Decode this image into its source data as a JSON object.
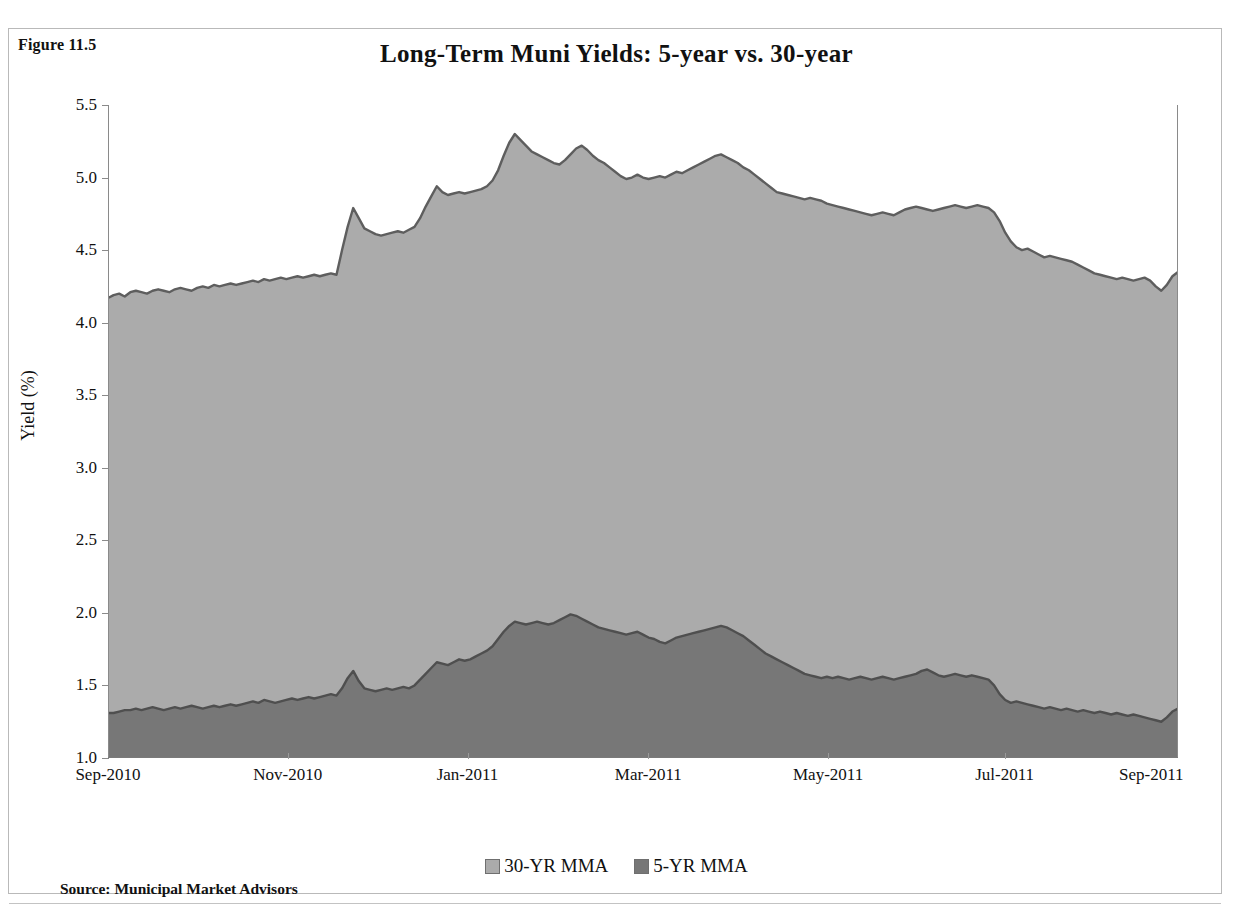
{
  "figure": {
    "label": "Figure 11.5",
    "title": "Long-Term Muni Yields: 5-year vs. 30-year",
    "source": "Source: Municipal Market Advisors"
  },
  "axes": {
    "ylabel": "Yield (%)",
    "xlabel": "",
    "yticks": [
      "1.0",
      "1.5",
      "2.0",
      "2.5",
      "3.0",
      "3.5",
      "4.0",
      "4.5",
      "5.0",
      "5.5"
    ],
    "xticks": [
      "Sep-2010",
      "Nov-2010",
      "Jan-2011",
      "Mar-2011",
      "May-2011",
      "Jul-2011",
      "Sep-2011"
    ]
  },
  "legend": [
    {
      "label": "30-YR MMA",
      "color": "#ababab"
    },
    {
      "label": "5-YR MMA",
      "color": "#777777"
    }
  ],
  "colors": {
    "band_30yr": "#ababab",
    "band_5yr": "#777777",
    "line_stroke": "#5e5e5e",
    "frame": "#b9b9b9",
    "axis": "#8a8a8a"
  },
  "chart_data": {
    "type": "area",
    "title": "Long-Term Muni Yields: 5-year vs. 30-year",
    "xlabel": "",
    "ylabel": "Yield (%)",
    "ylim": [
      1.0,
      5.5
    ],
    "ytick_step": 0.5,
    "grid": false,
    "legend_position": "bottom",
    "xlim": [
      "Sep-2010",
      "Oct-2011"
    ],
    "x_tick_labels": [
      "Sep-2010",
      "Nov-2010",
      "Jan-2011",
      "Mar-2011",
      "May-2011",
      "Jul-2011",
      "Sep-2011"
    ],
    "x_tick_fractions": [
      0.0,
      0.168,
      0.336,
      0.505,
      0.673,
      0.838,
      0.975
    ],
    "series": [
      {
        "name": "30-YR MMA",
        "color": "#ababab",
        "values": [
          4.17,
          4.19,
          4.2,
          4.18,
          4.21,
          4.22,
          4.21,
          4.2,
          4.22,
          4.23,
          4.22,
          4.21,
          4.23,
          4.24,
          4.23,
          4.22,
          4.24,
          4.25,
          4.24,
          4.26,
          4.25,
          4.26,
          4.27,
          4.26,
          4.27,
          4.28,
          4.29,
          4.28,
          4.3,
          4.29,
          4.3,
          4.31,
          4.3,
          4.31,
          4.32,
          4.31,
          4.32,
          4.33,
          4.32,
          4.33,
          4.34,
          4.33,
          4.5,
          4.66,
          4.79,
          4.72,
          4.65,
          4.63,
          4.61,
          4.6,
          4.61,
          4.62,
          4.63,
          4.62,
          4.64,
          4.66,
          4.72,
          4.8,
          4.87,
          4.94,
          4.9,
          4.88,
          4.89,
          4.9,
          4.89,
          4.9,
          4.91,
          4.92,
          4.94,
          4.98,
          5.05,
          5.15,
          5.24,
          5.3,
          5.26,
          5.22,
          5.18,
          5.16,
          5.14,
          5.12,
          5.1,
          5.09,
          5.12,
          5.16,
          5.2,
          5.22,
          5.19,
          5.15,
          5.12,
          5.1,
          5.07,
          5.04,
          5.01,
          4.99,
          5.0,
          5.02,
          5.0,
          4.99,
          5.0,
          5.01,
          5.0,
          5.02,
          5.04,
          5.03,
          5.05,
          5.07,
          5.09,
          5.11,
          5.13,
          5.15,
          5.16,
          5.14,
          5.12,
          5.1,
          5.07,
          5.05,
          5.02,
          4.99,
          4.96,
          4.93,
          4.9,
          4.89,
          4.88,
          4.87,
          4.86,
          4.85,
          4.86,
          4.85,
          4.84,
          4.82,
          4.81,
          4.8,
          4.79,
          4.78,
          4.77,
          4.76,
          4.75,
          4.74,
          4.75,
          4.76,
          4.75,
          4.74,
          4.76,
          4.78,
          4.79,
          4.8,
          4.79,
          4.78,
          4.77,
          4.78,
          4.79,
          4.8,
          4.81,
          4.8,
          4.79,
          4.8,
          4.81,
          4.8,
          4.79,
          4.76,
          4.7,
          4.62,
          4.56,
          4.52,
          4.5,
          4.51,
          4.49,
          4.47,
          4.45,
          4.46,
          4.45,
          4.44,
          4.43,
          4.42,
          4.4,
          4.38,
          4.36,
          4.34,
          4.33,
          4.32,
          4.31,
          4.3,
          4.31,
          4.3,
          4.29,
          4.3,
          4.31,
          4.29,
          4.25,
          4.22,
          4.26,
          4.32,
          4.35
        ]
      },
      {
        "name": "5-YR MMA",
        "color": "#777777",
        "values": [
          1.31,
          1.31,
          1.32,
          1.33,
          1.33,
          1.34,
          1.33,
          1.34,
          1.35,
          1.34,
          1.33,
          1.34,
          1.35,
          1.34,
          1.35,
          1.36,
          1.35,
          1.34,
          1.35,
          1.36,
          1.35,
          1.36,
          1.37,
          1.36,
          1.37,
          1.38,
          1.39,
          1.38,
          1.4,
          1.39,
          1.38,
          1.39,
          1.4,
          1.41,
          1.4,
          1.41,
          1.42,
          1.41,
          1.42,
          1.43,
          1.44,
          1.43,
          1.48,
          1.55,
          1.6,
          1.53,
          1.48,
          1.47,
          1.46,
          1.47,
          1.48,
          1.47,
          1.48,
          1.49,
          1.48,
          1.5,
          1.54,
          1.58,
          1.62,
          1.66,
          1.65,
          1.64,
          1.66,
          1.68,
          1.67,
          1.68,
          1.7,
          1.72,
          1.74,
          1.77,
          1.82,
          1.87,
          1.91,
          1.94,
          1.93,
          1.92,
          1.93,
          1.94,
          1.93,
          1.92,
          1.93,
          1.95,
          1.97,
          1.99,
          1.98,
          1.96,
          1.94,
          1.92,
          1.9,
          1.89,
          1.88,
          1.87,
          1.86,
          1.85,
          1.86,
          1.87,
          1.85,
          1.83,
          1.82,
          1.8,
          1.79,
          1.81,
          1.83,
          1.84,
          1.85,
          1.86,
          1.87,
          1.88,
          1.89,
          1.9,
          1.91,
          1.9,
          1.88,
          1.86,
          1.84,
          1.81,
          1.78,
          1.75,
          1.72,
          1.7,
          1.68,
          1.66,
          1.64,
          1.62,
          1.6,
          1.58,
          1.57,
          1.56,
          1.55,
          1.56,
          1.55,
          1.56,
          1.55,
          1.54,
          1.55,
          1.56,
          1.55,
          1.54,
          1.55,
          1.56,
          1.55,
          1.54,
          1.55,
          1.56,
          1.57,
          1.58,
          1.6,
          1.61,
          1.59,
          1.57,
          1.56,
          1.57,
          1.58,
          1.57,
          1.56,
          1.57,
          1.56,
          1.55,
          1.54,
          1.5,
          1.44,
          1.4,
          1.38,
          1.39,
          1.38,
          1.37,
          1.36,
          1.35,
          1.34,
          1.35,
          1.34,
          1.33,
          1.34,
          1.33,
          1.32,
          1.33,
          1.32,
          1.31,
          1.32,
          1.31,
          1.3,
          1.31,
          1.3,
          1.29,
          1.3,
          1.29,
          1.28,
          1.27,
          1.26,
          1.25,
          1.28,
          1.32,
          1.34
        ]
      }
    ]
  }
}
